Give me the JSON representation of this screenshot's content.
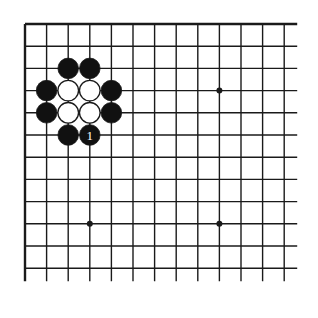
{
  "diagram": {
    "type": "go-board-fragment",
    "colors": {
      "line": "#1a1a1a",
      "black_stone": "#111111",
      "white_stone": "#ffffff",
      "background": "#ffffff",
      "label_on_black": "#ffffff"
    },
    "grid": {
      "columns": 13,
      "rows": 12,
      "origin_x": 25,
      "origin_y": 24,
      "spacing_x": 21.6,
      "spacing_y": 22.2,
      "extend_right": 13,
      "extend_bottom": 13,
      "edges": [
        "top",
        "left"
      ]
    },
    "star_points": [
      {
        "col": 3,
        "row": 9
      },
      {
        "col": 9,
        "row": 3
      },
      {
        "col": 9,
        "row": 9
      }
    ],
    "stones": [
      {
        "color": "black",
        "col": 2,
        "row": 2
      },
      {
        "color": "black",
        "col": 3,
        "row": 2
      },
      {
        "color": "black",
        "col": 1,
        "row": 3
      },
      {
        "color": "white",
        "col": 2,
        "row": 3
      },
      {
        "color": "white",
        "col": 3,
        "row": 3
      },
      {
        "color": "black",
        "col": 4,
        "row": 3
      },
      {
        "color": "black",
        "col": 1,
        "row": 4
      },
      {
        "color": "white",
        "col": 2,
        "row": 4
      },
      {
        "color": "white",
        "col": 3,
        "row": 4
      },
      {
        "color": "black",
        "col": 4,
        "row": 4
      },
      {
        "color": "black",
        "col": 2,
        "row": 5
      },
      {
        "color": "black",
        "col": 3,
        "row": 5,
        "label": "1"
      }
    ]
  }
}
